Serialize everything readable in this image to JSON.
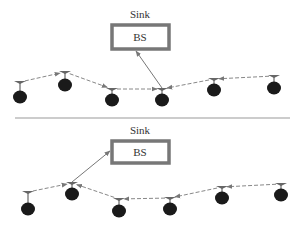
{
  "diagram": {
    "panels": [
      {
        "id": "top",
        "sink_label": "Sink",
        "bs_label": "BS",
        "nodes": [
          {
            "id": "n1",
            "x": 20,
            "y": 97,
            "ay": 82
          },
          {
            "id": "n2",
            "x": 65,
            "y": 85,
            "ay": 72
          },
          {
            "id": "n3",
            "x": 112,
            "y": 100,
            "ay": 89
          },
          {
            "id": "n4",
            "x": 162,
            "y": 100,
            "ay": 89
          },
          {
            "id": "n5",
            "x": 214,
            "y": 90,
            "ay": 79
          },
          {
            "id": "n6",
            "x": 274,
            "y": 88,
            "ay": 76
          }
        ],
        "hops": [
          {
            "from": "n1",
            "to": "n2"
          },
          {
            "from": "n2",
            "to": "n3"
          },
          {
            "from": "n3",
            "to": "n4"
          },
          {
            "from": "n5",
            "to": "n4"
          },
          {
            "from": "n6",
            "to": "n5"
          }
        ],
        "uplink_from": "n4"
      },
      {
        "id": "bottom",
        "sink_label": "Sink",
        "bs_label": "BS",
        "nodes": [
          {
            "id": "n1",
            "x": 28,
            "y": 209,
            "ay": 192
          },
          {
            "id": "n2",
            "x": 72,
            "y": 194,
            "ay": 183
          },
          {
            "id": "n3",
            "x": 119,
            "y": 211,
            "ay": 199
          },
          {
            "id": "n4",
            "x": 170,
            "y": 209,
            "ay": 198
          },
          {
            "id": "n5",
            "x": 222,
            "y": 198,
            "ay": 187
          },
          {
            "id": "n6",
            "x": 281,
            "y": 195,
            "ay": 184
          }
        ],
        "hops": [
          {
            "from": "n1",
            "to": "n2"
          },
          {
            "from": "n3",
            "to": "n2"
          },
          {
            "from": "n4",
            "to": "n3"
          },
          {
            "from": "n5",
            "to": "n4"
          },
          {
            "from": "n6",
            "to": "n5"
          }
        ],
        "uplink_from": "n2"
      }
    ]
  }
}
